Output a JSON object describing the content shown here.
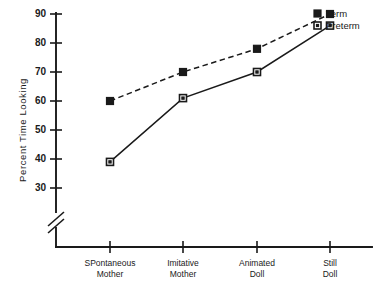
{
  "chart_data": {
    "type": "line",
    "title": "",
    "xlabel": "",
    "ylabel": "Percent Time Looking",
    "categories": [
      "SPontaneous Mother",
      "Imitative Mother",
      "Animated Doll",
      "Still Doll"
    ],
    "category_lines": [
      [
        "SPontaneous",
        "Mother"
      ],
      [
        "Imitative",
        "Mother"
      ],
      [
        "Animated",
        "Doll"
      ],
      [
        "Still",
        "Doll"
      ]
    ],
    "series": [
      {
        "name": "Term",
        "values": [
          60,
          70,
          78,
          90
        ],
        "marker": "filled-square",
        "line_style": "dashed"
      },
      {
        "name": "Preterm",
        "values": [
          39,
          61,
          70,
          86
        ],
        "marker": "open-square",
        "line_style": "solid"
      }
    ],
    "ylim": [
      30,
      90
    ],
    "yticks": [
      30,
      40,
      50,
      60,
      70,
      80,
      90
    ],
    "ytick_labels": [
      "30",
      "40",
      "50",
      "60",
      "70",
      "80",
      "90"
    ],
    "axis_break": true,
    "axis_break_note": "y-axis broken below 30",
    "grid": false,
    "legend_position": "top-right",
    "color": "#1a1a1a"
  },
  "legend": {
    "entries": [
      {
        "label": "Term"
      },
      {
        "label": "Preterm"
      }
    ]
  }
}
